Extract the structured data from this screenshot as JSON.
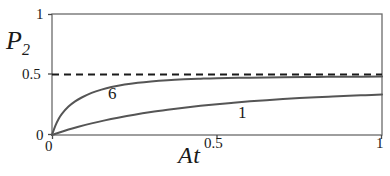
{
  "chart_data": {
    "type": "line",
    "title": "",
    "xlabel": "At",
    "ylabel": "P2",
    "ylabel_base": "P",
    "ylabel_sub": "2",
    "xlim": [
      0,
      1
    ],
    "ylim": [
      0,
      1
    ],
    "grid": false,
    "legend_position": "inline-curve-labels",
    "xticks": [
      0,
      0.5,
      1
    ],
    "xtick_labels": [
      "0",
      "0.5",
      "1"
    ],
    "yticks": [
      0,
      0.5,
      1
    ],
    "ytick_labels": [
      "0",
      "0.5",
      "1"
    ],
    "annotations": [
      {
        "name": "asymptote",
        "type": "horizontal-dashed-line",
        "value": 0.5,
        "style": "dashed",
        "color": "#1a1a1a"
      }
    ],
    "series": [
      {
        "name": "6",
        "label": "6",
        "color": "#555555",
        "style": "solid",
        "x": [
          0,
          0.01,
          0.02,
          0.03,
          0.05,
          0.07,
          0.09,
          0.12,
          0.15,
          0.18,
          0.22,
          0.26,
          0.3,
          0.35,
          0.4,
          0.45,
          0.5,
          0.6,
          0.7,
          0.8,
          0.9,
          1.0
        ],
        "y": [
          0,
          0.075,
          0.132,
          0.175,
          0.235,
          0.278,
          0.31,
          0.348,
          0.375,
          0.396,
          0.417,
          0.432,
          0.443,
          0.453,
          0.46,
          0.465,
          0.469,
          0.474,
          0.478,
          0.48,
          0.482,
          0.483
        ]
      },
      {
        "name": "1",
        "label": "1",
        "color": "#555555",
        "style": "solid",
        "x": [
          0,
          0.02,
          0.05,
          0.08,
          0.12,
          0.16,
          0.2,
          0.25,
          0.3,
          0.35,
          0.4,
          0.45,
          0.5,
          0.55,
          0.6,
          0.65,
          0.7,
          0.75,
          0.8,
          0.85,
          0.9,
          0.95,
          1.0
        ],
        "y": [
          0,
          0.019,
          0.045,
          0.068,
          0.096,
          0.121,
          0.143,
          0.168,
          0.19,
          0.209,
          0.226,
          0.241,
          0.255,
          0.267,
          0.278,
          0.288,
          0.297,
          0.305,
          0.312,
          0.318,
          0.324,
          0.329,
          0.334
        ]
      }
    ],
    "curve_labels": [
      {
        "text": "6",
        "x": 0.17,
        "y": 0.385
      },
      {
        "text": "1",
        "x": 0.58,
        "y": 0.25
      }
    ]
  },
  "axes": {
    "y_title_base": "P",
    "y_title_sub": "2",
    "x_title": "At"
  },
  "ticks": {
    "y_top": "1",
    "y_mid": "0.5",
    "y_bottom": "0",
    "x_left": "0",
    "x_mid": "0.5",
    "x_right": "1"
  },
  "labels": {
    "curve_six": "6",
    "curve_one": "1"
  },
  "colors": {
    "background": "#ffffff",
    "frame": "#6b6b6b",
    "curve": "#555555",
    "dashed": "#1a1a1a",
    "text": "#1a1a1a"
  }
}
